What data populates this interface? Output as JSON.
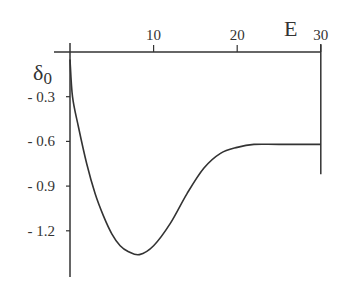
{
  "chart_data": {
    "type": "line",
    "title": "",
    "xlabel": "E",
    "ylabel": "δ0",
    "ylabel_main": "δ",
    "ylabel_sub": "0",
    "xlim": [
      0,
      30
    ],
    "ylim": [
      -1.5,
      0
    ],
    "x_axis_position": "top",
    "grid": false,
    "legend": null,
    "x_ticks": [
      10,
      20,
      30
    ],
    "x_tick_labels": [
      "10",
      "20",
      "30"
    ],
    "y_ticks": [
      -0.3,
      -0.6,
      -0.9,
      -1.2
    ],
    "y_tick_labels": [
      "- 0.3",
      "- 0.6",
      "- 0.9",
      "- 1.2"
    ],
    "series": [
      {
        "name": "δ0(E)",
        "color": "#333333",
        "x": [
          0,
          0.3,
          1,
          2,
          3,
          4,
          5,
          6,
          7,
          8.3,
          10,
          12,
          14,
          16,
          18,
          20,
          22,
          25,
          30
        ],
        "y": [
          -0.05,
          -0.3,
          -0.5,
          -0.75,
          -0.95,
          -1.1,
          -1.22,
          -1.3,
          -1.34,
          -1.36,
          -1.3,
          -1.15,
          -0.95,
          -0.78,
          -0.68,
          -0.64,
          -0.62,
          -0.62,
          -0.62
        ]
      }
    ],
    "right_boundary": {
      "x": 30,
      "y_from": 0,
      "y_to": -0.82
    }
  }
}
